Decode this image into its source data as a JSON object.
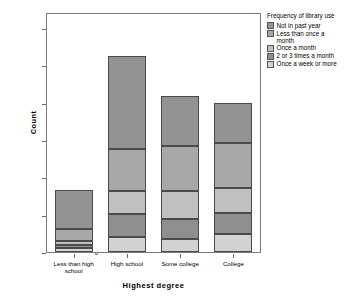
{
  "chart_data": {
    "type": "bar",
    "subtype": "stacked-bar",
    "title": "",
    "xlabel": "Highest degree",
    "ylabel": "Count",
    "ylim": [
      0,
      1200
    ],
    "yticks": [
      0,
      200,
      400,
      600,
      800,
      1000,
      1200
    ],
    "ytick_labels": [
      "0",
      "200",
      "400",
      "600",
      "800",
      "1,000",
      "1,200"
    ],
    "grid": false,
    "legend_title": "Frequency of library use",
    "legend_position": "right",
    "categories": [
      "Less than high school",
      "High school",
      "Some college",
      "College"
    ],
    "category_labels": [
      [
        "Less than high",
        "school"
      ],
      [
        "High school"
      ],
      [
        "Some college"
      ],
      [
        "College"
      ]
    ],
    "stack_order_bottom_to_top": [
      "Once a week or more",
      "2 or 3 times a month",
      "Once a month",
      "Less than once a month",
      "Not in past year"
    ],
    "series": [
      {
        "name": "Once a week or more",
        "color": "#d2d2d2",
        "values": [
          20,
          78,
          72,
          95
        ]
      },
      {
        "name": "2 or 3 times a month",
        "color": "#8f8f8f",
        "values": [
          15,
          124,
          106,
          115
        ]
      },
      {
        "name": "Once a month",
        "color": "#c0c0c0",
        "values": [
          23,
          125,
          149,
          135
        ]
      },
      {
        "name": "Less than once a month",
        "color": "#a8a8a8",
        "values": [
          67,
          223,
          243,
          238
        ]
      },
      {
        "name": "Not in past year",
        "color": "#939393",
        "values": [
          208,
          500,
          265,
          215
        ]
      }
    ],
    "totals": [
      333,
      1050,
      835,
      798
    ],
    "cumulative": {
      "Less than high school": [
        20,
        35,
        58,
        125,
        333
      ],
      "High school": [
        78,
        202,
        327,
        550,
        1050
      ],
      "Some college": [
        72,
        178,
        327,
        570,
        835
      ],
      "College": [
        95,
        210,
        345,
        583,
        798
      ]
    }
  },
  "legend": {
    "title": "Frequency of library use",
    "items": [
      {
        "label": "Not in past year",
        "label_lines": [
          "Not in past year"
        ],
        "color": "#939393"
      },
      {
        "label": "Less than once a month",
        "label_lines": [
          "Less than once a",
          "month"
        ],
        "color": "#a8a8a8"
      },
      {
        "label": "Once a month",
        "label_lines": [
          "Once a month"
        ],
        "color": "#c0c0c0"
      },
      {
        "label": "2 or 3 times a month",
        "label_lines": [
          "2 or 3 times a month"
        ],
        "color": "#8f8f8f"
      },
      {
        "label": "Once a week or more",
        "label_lines": [
          "Once a week or more"
        ],
        "color": "#d2d2d2"
      }
    ]
  },
  "axes": {
    "y_title": "Count",
    "x_title": "Highest degree"
  },
  "colors": {
    "frame": "#7a7a7a",
    "segment_border": "#4a4a4a",
    "background": "#ffffff",
    "text": "#000000"
  }
}
